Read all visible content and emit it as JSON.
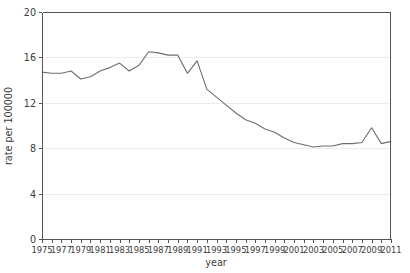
{
  "chart_data": {
    "type": "line",
    "title": "",
    "xlabel": "year",
    "ylabel": "rate per 100000",
    "xlim": [
      1975,
      2011
    ],
    "ylim": [
      0,
      20
    ],
    "grid": true,
    "legend": "none",
    "y_ticks": [
      0,
      4,
      8,
      12,
      16,
      20
    ],
    "y_tick_labels": [
      "0",
      "4",
      "8",
      "12",
      "16",
      "20"
    ],
    "x_ticks": [
      1975,
      1977,
      1979,
      1981,
      1983,
      1985,
      1987,
      1989,
      1991,
      1993,
      1995,
      1997,
      1999,
      2001,
      2003,
      2005,
      2007,
      2009,
      2011
    ],
    "x_tick_labels": [
      "1975",
      "1977",
      "1979",
      "1981",
      "1983",
      "1985",
      "1987",
      "1989",
      "1991",
      "1993",
      "1995",
      "1997",
      "1999",
      "2001",
      "2003",
      "2005",
      "2007",
      "2009",
      "2011"
    ],
    "x_minor_ticks_every": 1,
    "line_color": "#6e6e6e",
    "grid_color": "#ececec",
    "axis_color": "#555555",
    "background_color": "#ffffff",
    "x": [
      1975,
      1976,
      1977,
      1978,
      1979,
      1980,
      1981,
      1982,
      1983,
      1984,
      1985,
      1986,
      1987,
      1988,
      1989,
      1990,
      1991,
      1992,
      1993,
      1994,
      1995,
      1996,
      1997,
      1998,
      1999,
      2000,
      2001,
      2002,
      2003,
      2004,
      2005,
      2006,
      2007,
      2008,
      2009,
      2010,
      2011
    ],
    "values": [
      14.7,
      14.6,
      14.6,
      14.8,
      14.1,
      14.3,
      14.8,
      15.1,
      15.5,
      14.8,
      15.3,
      16.5,
      16.4,
      16.2,
      16.2,
      14.6,
      15.7,
      13.2,
      12.5,
      11.8,
      11.1,
      10.5,
      10.2,
      9.7,
      9.4,
      8.9,
      8.5,
      8.3,
      8.1,
      8.2,
      8.2,
      8.4,
      8.4,
      8.5,
      9.8,
      8.4,
      8.6
    ],
    "series_name": "rate per 100000"
  }
}
